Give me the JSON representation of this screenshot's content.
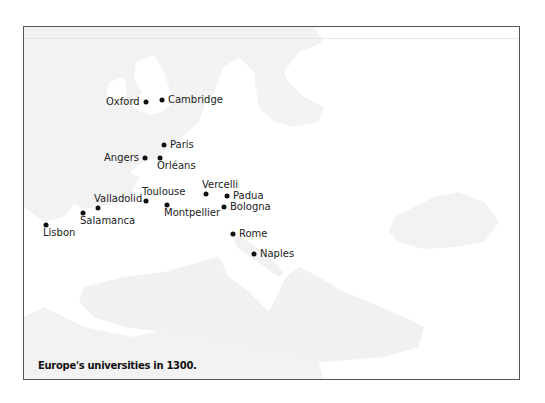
{
  "map": {
    "title": "Europe's universities in 1300.",
    "sea_color": "#f1f1f1",
    "land_color": "#ffffff",
    "dot_color": "#111111",
    "cities": [
      {
        "name": "Oxford",
        "x": 146,
        "y": 102,
        "label_pos": "left"
      },
      {
        "name": "Cambridge",
        "x": 162,
        "y": 100,
        "label_pos": "right"
      },
      {
        "name": "Paris",
        "x": 164,
        "y": 145,
        "label_pos": "right"
      },
      {
        "name": "Angers",
        "x": 145,
        "y": 158,
        "label_pos": "left"
      },
      {
        "name": "Orléans",
        "x": 160,
        "y": 158,
        "label_pos": "below"
      },
      {
        "name": "Toulouse",
        "x": 146,
        "y": 201,
        "label_pos": "above"
      },
      {
        "name": "Montpellier",
        "x": 167,
        "y": 205,
        "label_pos": "below"
      },
      {
        "name": "Valladolid",
        "x": 98,
        "y": 208,
        "label_pos": "above"
      },
      {
        "name": "Salamanca",
        "x": 83,
        "y": 213,
        "label_pos": "below"
      },
      {
        "name": "Lisbon",
        "x": 46,
        "y": 225,
        "label_pos": "below"
      },
      {
        "name": "Vercelli",
        "x": 206,
        "y": 194,
        "label_pos": "above"
      },
      {
        "name": "Padua",
        "x": 227,
        "y": 196,
        "label_pos": "right"
      },
      {
        "name": "Bologna",
        "x": 224,
        "y": 207,
        "label_pos": "right"
      },
      {
        "name": "Rome",
        "x": 233,
        "y": 234,
        "label_pos": "right"
      },
      {
        "name": "Naples",
        "x": 254,
        "y": 254,
        "label_pos": "right"
      }
    ]
  }
}
